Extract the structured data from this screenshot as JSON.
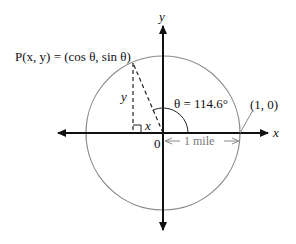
{
  "diagram": {
    "type": "unit-circle",
    "axes": {
      "x_label": "x",
      "y_label": "y",
      "origin_label": "0"
    },
    "point_label": "P(x, y) = (cos θ, sin θ)",
    "angle_label": "θ = 114.6°",
    "angle_degrees": 114.6,
    "reference_point_label": "(1, 0)",
    "radius_label": "1 mile",
    "leg_labels": {
      "vertical": "y",
      "horizontal": "x"
    },
    "colors": {
      "axes": "#111111",
      "circle": "#888888",
      "dashed": "#222222"
    }
  }
}
